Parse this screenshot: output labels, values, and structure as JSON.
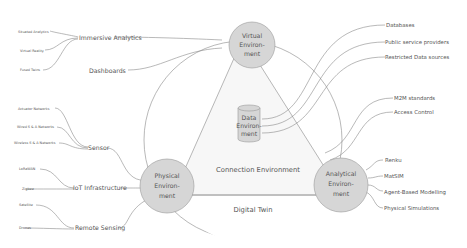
{
  "diagram": {
    "title": "Digital Twin",
    "colors": {
      "node_fill": "#d6d6d6",
      "node_stroke": "#999999",
      "line": "#8a8a8a",
      "text": "#555555",
      "triangle_fill": "#f7f7f7",
      "background": "#ffffff"
    },
    "outer_circle_label": "Digital Twin",
    "triangle_label": "Connection Environment",
    "nodes": {
      "virtual": {
        "line1": "Virtual",
        "line2": "Environ-",
        "line3": "ment"
      },
      "physical": {
        "line1": "Physical",
        "line2": "Environ-",
        "line3": "ment"
      },
      "analytical": {
        "line1": "Analytical",
        "line2": "Environ-",
        "line3": "ment"
      },
      "data": {
        "line1": "Data",
        "line2": "Environ-",
        "line3": "ment"
      }
    },
    "virtual_branches": {
      "immersive_analytics": {
        "label": "Immersive Analytics",
        "children": [
          "Situated Analytics",
          "Virtual Reality",
          "Fused Twins"
        ]
      },
      "dashboards": {
        "label": "Dashboards"
      }
    },
    "physical_branches": {
      "sensor": {
        "label": "Sensor",
        "children": [
          "Actuator Networks",
          "Wired S & A Networks",
          "Wireless S & A Networks"
        ]
      },
      "iot": {
        "label": "IoT Infrastructure",
        "children": [
          "LoRaWAN",
          "Zigbee"
        ]
      },
      "remote_sensing": {
        "label": "Remote Sensing",
        "children": [
          "Satellite",
          "Drones"
        ]
      }
    },
    "data_branches": [
      "Databases",
      "Public service providers",
      "Restricted Data sources"
    ],
    "connection_branches": [
      "M2M standards",
      "Access Control"
    ],
    "analytical_branches": [
      "Renku",
      "MatSIM",
      "Agent-Based Modelling",
      "Physical Simulations"
    ]
  }
}
